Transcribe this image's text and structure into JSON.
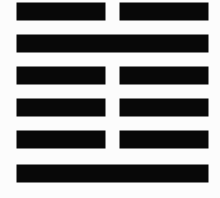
{
  "figure": {
    "kind": "iching-hexagram",
    "name": "Hexagram 27",
    "chinese_name": "頤",
    "pinyin": "Yí",
    "english_name": "Corners of the Mouth / Nourishment",
    "background_color": "#fcfcfc",
    "line_color": "#080808",
    "upper_trigram": "Gen (Mountain)",
    "lower_trigram": "Zhen (Thunder)",
    "binary_bottom_up": "100001",
    "rows_top_to_bottom": [
      {
        "position_from_top": 1,
        "position_from_bottom": 6,
        "type": "yin",
        "label": "broken",
        "value": 0
      },
      {
        "position_from_top": 2,
        "position_from_bottom": 5,
        "type": "yang",
        "label": "solid",
        "value": 1
      },
      {
        "position_from_top": 3,
        "position_from_bottom": 4,
        "type": "yin",
        "label": "broken",
        "value": 0
      },
      {
        "position_from_top": 4,
        "position_from_bottom": 3,
        "type": "yin",
        "label": "broken",
        "value": 0
      },
      {
        "position_from_top": 5,
        "position_from_bottom": 2,
        "type": "yin",
        "label": "broken",
        "value": 0
      },
      {
        "position_from_top": 6,
        "position_from_bottom": 1,
        "type": "yang",
        "label": "solid",
        "value": 1
      }
    ]
  }
}
